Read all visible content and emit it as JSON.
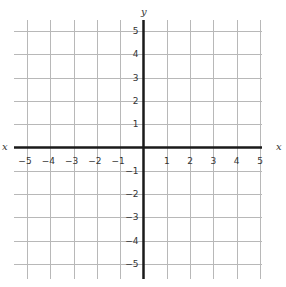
{
  "diagram": {
    "type": "coordinate-plane",
    "axes": {
      "x_label": "x",
      "y_label": "y",
      "x_range": [
        -5,
        5
      ],
      "y_range": [
        -5,
        5
      ],
      "x_ticks": [
        "−5",
        "−4",
        "−3",
        "−2",
        "−1",
        "1",
        "2",
        "3",
        "4",
        "5"
      ],
      "y_ticks": [
        "5",
        "4",
        "3",
        "2",
        "1",
        "−1",
        "−2",
        "−3",
        "−4",
        "−5"
      ]
    },
    "grid": {
      "on": true,
      "step": 1
    },
    "colors": {
      "grid": "#b8b8b8",
      "axis": "#1a1a1a",
      "label": "#333333",
      "background": "#ffffff"
    }
  }
}
